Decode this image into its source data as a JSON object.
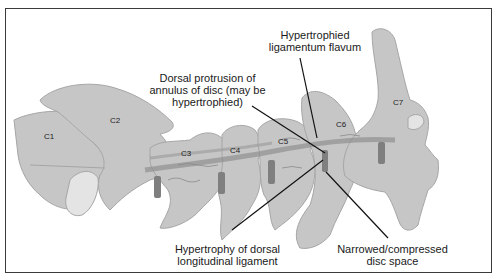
{
  "diagram": {
    "colors": {
      "bone": "#c6c6c6",
      "bone_outline": "#a6a6a6",
      "bone_light": "#e4e4e4",
      "disc": "#7f7f7f",
      "ligament": "#8c8c8c",
      "leader_line": "#111111",
      "frame": "#3a3a3a"
    },
    "vertebrae": [
      {
        "id": "C1",
        "label": "C1"
      },
      {
        "id": "C2",
        "label": "C2"
      },
      {
        "id": "C3",
        "label": "C3"
      },
      {
        "id": "C4",
        "label": "C4"
      },
      {
        "id": "C5",
        "label": "C5"
      },
      {
        "id": "C6",
        "label": "C6"
      },
      {
        "id": "C7",
        "label": "C7"
      }
    ],
    "annotations": [
      {
        "id": "ligamentum-flavum",
        "line1": "Hypertrophied",
        "line2": "ligamentum flavum"
      },
      {
        "id": "annulus",
        "line1": "Dorsal protrusion of",
        "line2": "annulus of disc (may be",
        "line3": "hypertrophied)"
      },
      {
        "id": "longitudinal-ligament",
        "line1": "Hypertrophy of dorsal",
        "line2": "longitudinal ligament"
      },
      {
        "id": "disc-space",
        "line1": "Narrowed/compressed",
        "line2": "disc space"
      }
    ]
  }
}
